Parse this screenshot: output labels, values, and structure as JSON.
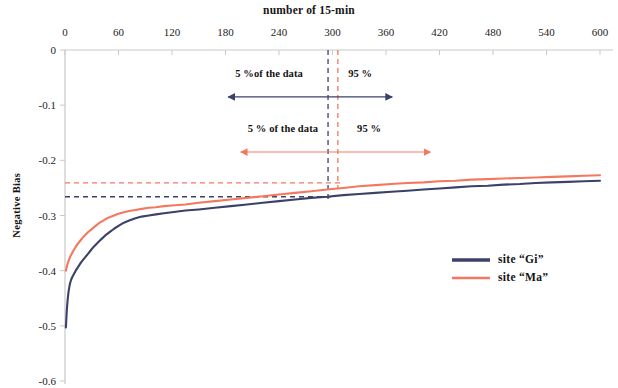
{
  "chart_data": {
    "type": "line",
    "title": "number of 15-min",
    "xlabel": "",
    "ylabel": "Negative Bias",
    "xlim": [
      0,
      600
    ],
    "ylim": [
      -0.6,
      0
    ],
    "grid": false,
    "legend_position": "right-middle",
    "x_ticks": [
      0,
      60,
      120,
      180,
      240,
      300,
      360,
      420,
      480,
      540,
      600
    ],
    "y_ticks": [
      0,
      -0.1,
      -0.2,
      -0.3,
      -0.4,
      -0.5,
      -0.6
    ],
    "x_tick_labels": [
      "0",
      "60",
      "120",
      "180",
      "240",
      "300",
      "360",
      "420",
      "480",
      "540",
      "600"
    ],
    "y_tick_labels": [
      "0",
      "-0.1",
      "-0.2",
      "-0.3",
      "-0.4",
      "-0.5",
      "-0.6"
    ],
    "x_axis_position": "top",
    "series": [
      {
        "name": "site “Gi”",
        "color": "#3b4168",
        "x": [
          1,
          2,
          3,
          4,
          5,
          6,
          7,
          8,
          9,
          10,
          12,
          14,
          16,
          18,
          20,
          23,
          26,
          29,
          32,
          35,
          38,
          42,
          46,
          50,
          55,
          60,
          66,
          72,
          79,
          86,
          94,
          102,
          111,
          120,
          135,
          150,
          168,
          186,
          204,
          222,
          240,
          258,
          276,
          294,
          312,
          330,
          348,
          366,
          384,
          402,
          420,
          438,
          456,
          474,
          492,
          510,
          528,
          546,
          564,
          582,
          600
        ],
        "y": [
          -0.503,
          -0.472,
          -0.452,
          -0.438,
          -0.428,
          -0.421,
          -0.416,
          -0.412,
          -0.409,
          -0.406,
          -0.4,
          -0.395,
          -0.39,
          -0.385,
          -0.381,
          -0.375,
          -0.369,
          -0.363,
          -0.357,
          -0.352,
          -0.347,
          -0.341,
          -0.335,
          -0.33,
          -0.324,
          -0.319,
          -0.313,
          -0.309,
          -0.305,
          -0.302,
          -0.3,
          -0.298,
          -0.296,
          -0.294,
          -0.291,
          -0.289,
          -0.286,
          -0.283,
          -0.28,
          -0.277,
          -0.274,
          -0.271,
          -0.268,
          -0.266,
          -0.263,
          -0.261,
          -0.259,
          -0.257,
          -0.255,
          -0.253,
          -0.251,
          -0.249,
          -0.247,
          -0.246,
          -0.244,
          -0.243,
          -0.241,
          -0.24,
          -0.239,
          -0.238,
          -0.237
        ]
      },
      {
        "name": "site “Ma”",
        "color": "#f4785f",
        "x": [
          1,
          2,
          3,
          4,
          5,
          6,
          7,
          8,
          9,
          10,
          12,
          14,
          16,
          18,
          20,
          23,
          26,
          29,
          32,
          35,
          38,
          42,
          46,
          50,
          55,
          60,
          66,
          72,
          79,
          86,
          94,
          102,
          111,
          120,
          135,
          150,
          168,
          186,
          204,
          222,
          240,
          258,
          276,
          294,
          312,
          330,
          348,
          366,
          384,
          402,
          420,
          438,
          456,
          474,
          492,
          510,
          528,
          546,
          564,
          582,
          600
        ],
        "y": [
          -0.4,
          -0.393,
          -0.387,
          -0.382,
          -0.378,
          -0.374,
          -0.371,
          -0.368,
          -0.365,
          -0.362,
          -0.357,
          -0.352,
          -0.348,
          -0.344,
          -0.34,
          -0.335,
          -0.33,
          -0.326,
          -0.322,
          -0.318,
          -0.314,
          -0.31,
          -0.306,
          -0.303,
          -0.3,
          -0.297,
          -0.294,
          -0.292,
          -0.29,
          -0.288,
          -0.286,
          -0.285,
          -0.283,
          -0.282,
          -0.28,
          -0.277,
          -0.274,
          -0.271,
          -0.268,
          -0.265,
          -0.262,
          -0.259,
          -0.256,
          -0.253,
          -0.25,
          -0.247,
          -0.245,
          -0.243,
          -0.241,
          -0.24,
          -0.238,
          -0.237,
          -0.235,
          -0.234,
          -0.233,
          -0.232,
          -0.231,
          -0.23,
          -0.229,
          -0.228,
          -0.227
        ]
      }
    ],
    "reference_lines": [
      {
        "name": "gi-mean-horizontal",
        "orientation": "horizontal",
        "value": -0.266,
        "color": "#3b4168",
        "style": "dashed",
        "x_from": 0,
        "x_to": 300
      },
      {
        "name": "ma-mean-horizontal",
        "orientation": "horizontal",
        "value": -0.241,
        "color": "#f4785f",
        "style": "dashed",
        "x_from": 0,
        "x_to": 310
      },
      {
        "name": "gi-percentile-vertical",
        "orientation": "vertical",
        "value": 295,
        "color": "#3b4168",
        "style": "dashed",
        "y_from": 0,
        "y_to": -0.27
      },
      {
        "name": "ma-percentile-vertical",
        "orientation": "vertical",
        "value": 306,
        "color": "#f4785f",
        "style": "dashed",
        "y_from": 0,
        "y_to": -0.25
      }
    ],
    "annotations": [
      {
        "name": "gi-split-annotation",
        "left_text": "5 %of the data",
        "right_text": "95 %",
        "color": "#3b4168",
        "arrow_x_from": 183,
        "arrow_x_to": 367,
        "arrow_y": -0.085,
        "text_y": -0.045
      },
      {
        "name": "ma-split-annotation",
        "left_text": "5 % of the data",
        "right_text": "95 %",
        "color": "#f4785f",
        "arrow_x_from": 197,
        "arrow_x_to": 410,
        "arrow_y": -0.185,
        "text_y": -0.145
      }
    ]
  },
  "legend": {
    "entries": [
      {
        "label": "site “Gi”",
        "color": "#3b4168"
      },
      {
        "label": "site “Ma”",
        "color": "#f4785f"
      }
    ]
  },
  "colors": {
    "gi": "#3b4168",
    "ma": "#f4785f",
    "axis": "#c9c9c9",
    "text": "#1a1a1a"
  }
}
